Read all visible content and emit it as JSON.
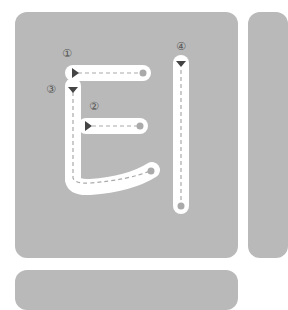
{
  "character": "티",
  "strokes": [
    {
      "order": "①",
      "direction": "right"
    },
    {
      "order": "②",
      "direction": "right"
    },
    {
      "order": "③",
      "direction": "down"
    },
    {
      "order": "④",
      "direction": "down"
    }
  ],
  "colors": {
    "card": "#b9b9b9",
    "stroke": "#ffffff",
    "guide": "#aaaaaa",
    "arrow": "#444444",
    "number": "#555555"
  }
}
